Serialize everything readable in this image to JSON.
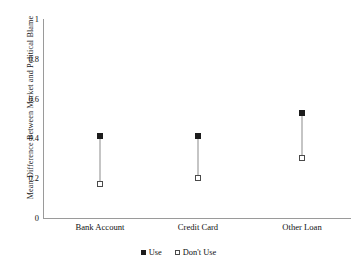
{
  "chart_data": {
    "type": "scatter",
    "title": "",
    "xlabel": "",
    "ylabel": "Mean Difference Between Market and Political Blame",
    "categories": [
      "Bank Account",
      "Credit Card",
      "Other Loan"
    ],
    "series": [
      {
        "name": "Use",
        "marker": "filled-square",
        "values": [
          0.41,
          0.41,
          0.53
        ]
      },
      {
        "name": "Don't Use",
        "marker": "open-square",
        "values": [
          0.17,
          0.2,
          0.3
        ]
      }
    ],
    "connectors": true,
    "ylim": [
      0,
      1
    ],
    "yticks": [
      "0",
      "0.2",
      "0.4",
      "0.6",
      "0.8",
      "1"
    ],
    "ytick_values": [
      0,
      0.2,
      0.4,
      0.6,
      0.8,
      1
    ],
    "grid": false,
    "legend_position": "bottom-center",
    "legend_entries": [
      "Use",
      "Don't Use"
    ],
    "axis_color": "#9a9a9a",
    "marker_fill_color": "#1c1c1c",
    "marker_open_border_color": "#4a4a4a",
    "connector_color": "#8b8b8b"
  }
}
